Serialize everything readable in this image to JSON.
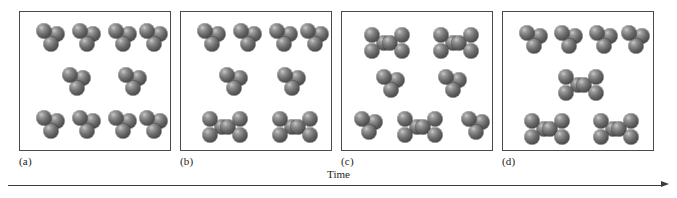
{
  "figure": {
    "caption_axis_label": "Time",
    "axis_direction": "left-to-right",
    "panel_count": 4,
    "atom_color": "#5a5a5a",
    "border_color": "#4a4a4a",
    "background": "#ffffff"
  },
  "panels": [
    {
      "id": "a",
      "label": "(a)",
      "triatomic_count": 10,
      "hexatomic_count": 0,
      "molecules": [
        {
          "type": "triatomic",
          "x": 30,
          "y": 26,
          "rot": 0
        },
        {
          "type": "triatomic",
          "x": 66,
          "y": 26,
          "rot": 0
        },
        {
          "type": "triatomic",
          "x": 102,
          "y": 26,
          "rot": 0
        },
        {
          "type": "triatomic",
          "x": 133,
          "y": 26,
          "rot": 0
        },
        {
          "type": "triatomic",
          "x": 56,
          "y": 70,
          "rot": 0
        },
        {
          "type": "triatomic",
          "x": 112,
          "y": 70,
          "rot": 0
        },
        {
          "type": "triatomic",
          "x": 30,
          "y": 113,
          "rot": 0
        },
        {
          "type": "triatomic",
          "x": 66,
          "y": 113,
          "rot": 0
        },
        {
          "type": "triatomic",
          "x": 102,
          "y": 113,
          "rot": 0
        },
        {
          "type": "triatomic",
          "x": 133,
          "y": 113,
          "rot": 0
        }
      ]
    },
    {
      "id": "b",
      "label": "(b)",
      "triatomic_count": 6,
      "hexatomic_count": 2,
      "molecules": [
        {
          "type": "triatomic",
          "x": 30,
          "y": 26,
          "rot": 0
        },
        {
          "type": "triatomic",
          "x": 66,
          "y": 26,
          "rot": 0
        },
        {
          "type": "triatomic",
          "x": 102,
          "y": 26,
          "rot": 0
        },
        {
          "type": "triatomic",
          "x": 133,
          "y": 26,
          "rot": 0
        },
        {
          "type": "triatomic",
          "x": 52,
          "y": 70,
          "rot": 0
        },
        {
          "type": "triatomic",
          "x": 110,
          "y": 70,
          "rot": 0
        },
        {
          "type": "hexatomic",
          "x": 44,
          "y": 115,
          "rot": 0
        },
        {
          "type": "hexatomic",
          "x": 114,
          "y": 115,
          "rot": 0
        }
      ]
    },
    {
      "id": "c",
      "label": "(c)",
      "triatomic_count": 4,
      "hexatomic_count": 3,
      "molecules": [
        {
          "type": "hexatomic",
          "x": 45,
          "y": 31,
          "rot": 0
        },
        {
          "type": "hexatomic",
          "x": 114,
          "y": 31,
          "rot": 0
        },
        {
          "type": "triatomic",
          "x": 48,
          "y": 72,
          "rot": 0
        },
        {
          "type": "triatomic",
          "x": 110,
          "y": 72,
          "rot": 0
        },
        {
          "type": "triatomic",
          "x": 26,
          "y": 114,
          "rot": 0
        },
        {
          "type": "hexatomic",
          "x": 78,
          "y": 115,
          "rot": 0
        },
        {
          "type": "triatomic",
          "x": 133,
          "y": 114,
          "rot": 0
        }
      ]
    },
    {
      "id": "d",
      "label": "(d)",
      "triatomic_count": 4,
      "hexatomic_count": 3,
      "molecules": [
        {
          "type": "triatomic",
          "x": 30,
          "y": 28,
          "rot": 0
        },
        {
          "type": "triatomic",
          "x": 65,
          "y": 28,
          "rot": 0
        },
        {
          "type": "triatomic",
          "x": 100,
          "y": 28,
          "rot": 0
        },
        {
          "type": "triatomic",
          "x": 132,
          "y": 28,
          "rot": 0
        },
        {
          "type": "hexatomic",
          "x": 78,
          "y": 73,
          "rot": 0
        },
        {
          "type": "hexatomic",
          "x": 44,
          "y": 117,
          "rot": 0
        },
        {
          "type": "hexatomic",
          "x": 113,
          "y": 117,
          "rot": 0
        }
      ]
    }
  ]
}
